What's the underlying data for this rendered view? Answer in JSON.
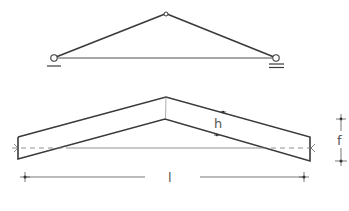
{
  "diagram": {
    "title": "",
    "truss": {
      "description": "Three-hinged frame with pinned supports",
      "left_support": "pin-support",
      "right_support": "roller-support"
    },
    "beam": {
      "description": "Pitched beam elevation",
      "labels": {
        "depth": "h",
        "rise": "f",
        "span": "l"
      }
    },
    "colors": {
      "line": "#3a3a3a",
      "dim": "#555555",
      "background": "#ffffff"
    }
  }
}
